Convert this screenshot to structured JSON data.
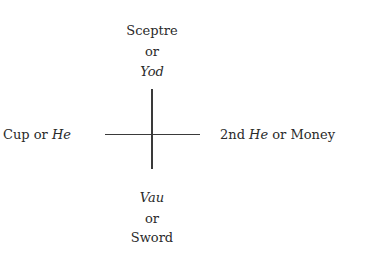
{
  "diagram": {
    "top": {
      "line1": "Sceptre",
      "line2": "or",
      "line3": "Yod"
    },
    "bottom": {
      "line1": "Vau",
      "line2": "or",
      "line3": "Sword"
    },
    "left": {
      "text": "Cup or ",
      "italic": "He"
    },
    "right": {
      "prefix": "2nd ",
      "italic": "He",
      "suffix": " or Money"
    }
  }
}
